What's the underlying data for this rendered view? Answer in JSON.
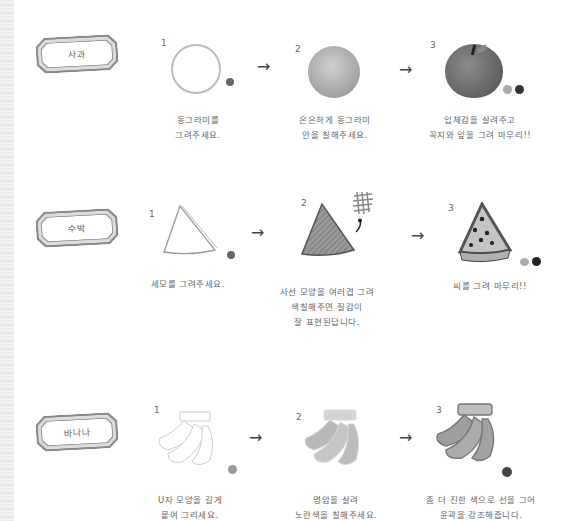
{
  "sections": [
    {
      "label": "사과",
      "steps": [
        {
          "number": "1",
          "caption_lines": [
            "동그라미를",
            "그려주세요."
          ]
        },
        {
          "number": "2",
          "caption_lines": [
            "은은하게 동그라미",
            "안을 칠해주세요."
          ]
        },
        {
          "number": "3",
          "caption_lines": [
            "입체감을 살려주고",
            "꼭지와 잎을 그려 마무리!!"
          ]
        }
      ]
    },
    {
      "label": "수박",
      "steps": [
        {
          "number": "1",
          "caption_lines": [
            "세모를 그려주세요."
          ]
        },
        {
          "number": "2",
          "caption_lines": [
            "사선 모양을 여러겹 그려",
            "색칠해주면 질감이",
            "잘 표현된답니다."
          ]
        },
        {
          "number": "3",
          "caption_lines": [
            "씨를 그려 마무리!!"
          ]
        }
      ]
    },
    {
      "label": "바나나",
      "steps": [
        {
          "number": "1",
          "caption_lines": [
            "U자 모양을 길게",
            "붙여 그리세요."
          ]
        },
        {
          "number": "2",
          "caption_lines": [
            "명암을 살려",
            "노란색을 칠해주세요."
          ]
        },
        {
          "number": "3",
          "caption_lines": [
            "좀 더 진한 색으로 선을 그어",
            "윤곽을 강조해줍니다."
          ]
        }
      ]
    }
  ],
  "arrow_glyph": "→",
  "colors": {
    "frame_outer": "#8a8a8a",
    "ink": "#666666",
    "swatch_dark": "#555555",
    "swatch_light": "#aaaaaa",
    "swatch_black": "#222222"
  }
}
